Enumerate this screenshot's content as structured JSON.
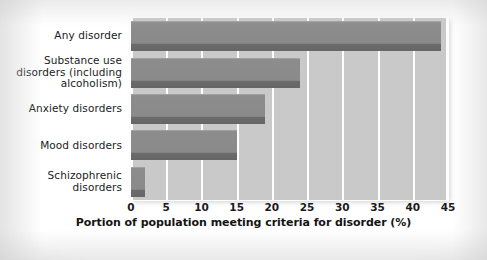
{
  "chart_data": {
    "type": "bar",
    "orientation": "horizontal",
    "title": "",
    "xlabel": "Portion of population meeting criteria for disorder (%)",
    "ylabel": "",
    "categories": [
      "Any disorder",
      "Substance use disorders (including alcoholism)",
      "Anxiety disorders",
      "Mood disorders",
      "Schizophrenic disorders"
    ],
    "category_lines": [
      [
        "Any disorder"
      ],
      [
        "Substance use",
        "disorders (including",
        "alcoholism)"
      ],
      [
        "Anxiety disorders"
      ],
      [
        "Mood disorders"
      ],
      [
        "Schizophrenic",
        "disorders"
      ]
    ],
    "values": [
      44,
      24,
      19,
      15,
      2
    ],
    "xlim": [
      0,
      45
    ],
    "xticks": [
      0,
      5,
      10,
      15,
      20,
      25,
      30,
      35,
      40,
      45
    ],
    "xtick_labels": [
      "0",
      "5",
      "10",
      "15",
      "20",
      "25",
      "30",
      "35",
      "40",
      "45"
    ],
    "grid": "vertical-white",
    "legend": "none",
    "colors": {
      "bar_fill": "#8d8d8d",
      "bar_shadow": "#6b6b6b",
      "plot_background": "#c9c9c9",
      "gridline": "#ffffff",
      "text": "#1b1b1b",
      "page_background": "#ffffff"
    }
  }
}
